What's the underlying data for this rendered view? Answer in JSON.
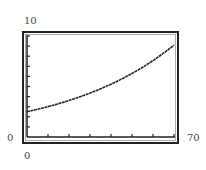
{
  "chart_data": {
    "type": "line",
    "title": "",
    "xlabel": "",
    "ylabel": "",
    "xlim": [
      0,
      70
    ],
    "ylim": [
      0,
      10
    ],
    "x_tick_step": 10,
    "y_tick_step": 1,
    "grid": false,
    "legend": null,
    "window_labels": {
      "xmin": "0",
      "xmax": "70",
      "ymin": "0",
      "ymax": "10"
    },
    "series": [
      {
        "name": "curve",
        "x": [
          0,
          10,
          20,
          30,
          40,
          50,
          60,
          70
        ],
        "y": [
          2.5,
          3.0,
          3.6,
          4.35,
          5.2,
          6.3,
          7.6,
          9.1
        ]
      }
    ],
    "colors": {
      "line": "#222222",
      "frame": "#222222",
      "background": "#ffffff"
    }
  }
}
